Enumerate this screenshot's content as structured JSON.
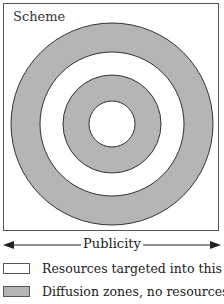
{
  "diagram": {
    "title": "Scheme",
    "rings": [
      {
        "radius": 101,
        "fill": "#b5b5b5",
        "role": "diffusion"
      },
      {
        "radius": 71,
        "fill": "#ffffff",
        "role": "resources"
      },
      {
        "radius": 50,
        "fill": "#b5b5b5",
        "role": "diffusion"
      },
      {
        "radius": 22,
        "fill": "#ffffff",
        "role": "resources"
      }
    ],
    "center": {
      "x": 112,
      "y": 124
    },
    "axis_label": "Publicity"
  },
  "legend": [
    {
      "label": "Resources targeted into this area",
      "color": "#ffffff"
    },
    {
      "label": "Diffusion zones, no resources",
      "color": "#b5b5b5"
    }
  ]
}
